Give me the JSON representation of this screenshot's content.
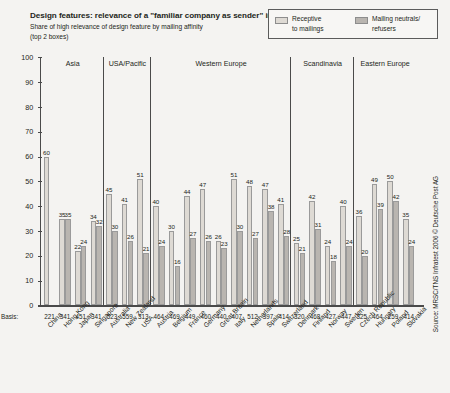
{
  "header": {
    "title": "Design features: relevance of a \"familiar company as sender\" in %",
    "subtitle_line1": "Share of high relevance of design feature by mailing affinity",
    "subtitle_line2": "(top 2 boxes)"
  },
  "legend": {
    "items": [
      {
        "label": "Receptive\nto mailings",
        "color": "#dedad4"
      },
      {
        "label": "Mailing neutrals/\nrefusers",
        "color": "#b9b5b0"
      }
    ]
  },
  "source": "Source: MRSC/TNS Infratest 2006 © Deutsche Post AG",
  "axis": {
    "basis_label": "Basis:",
    "y_ticks": [
      "100",
      "90",
      "80",
      "70",
      "60",
      "50",
      "40",
      "30",
      "20",
      "10",
      "0"
    ]
  },
  "chart_data": {
    "type": "bar",
    "title": "Design features: relevance of a \"familiar company as sender\" in %",
    "subtitle": "Share of high relevance of design feature by mailing affinity (top 2 boxes)",
    "xlabel": "",
    "ylabel": "%",
    "ylim": [
      0,
      100
    ],
    "ytick_step": 10,
    "grid": false,
    "legend_position": "top-right",
    "categories": [
      "China",
      "Hong Kong",
      "Japan",
      "Singapore",
      "Australia",
      "New Zealand",
      "USA",
      "Austria",
      "Belgium",
      "France",
      "Germany",
      "Great Britain",
      "Italy",
      "Netherlands",
      "Spain",
      "Switzerland",
      "Denmark",
      "Finland",
      "Norway",
      "Sweden",
      "Czech Republic",
      "Hungary",
      "Poland",
      "Slovakia"
    ],
    "basis": [
      221,
      341,
      451,
      341,
      523,
      559,
      313,
      464,
      469,
      449,
      460,
      440,
      407,
      512,
      397,
      414,
      320,
      468,
      427,
      447,
      325,
      464,
      259,
      414
    ],
    "series": [
      {
        "name": "Receptive to mailings",
        "color": "#dedad4",
        "values": [
          60,
          35,
          22,
          34,
          45,
          41,
          51,
          40,
          30,
          44,
          47,
          26,
          51,
          48,
          47,
          41,
          25,
          42,
          24,
          40,
          36,
          49,
          50,
          35
        ]
      },
      {
        "name": "Mailing neutrals/refusers",
        "color": "#b9b5b0",
        "values": [
          null,
          35,
          24,
          32,
          30,
          26,
          21,
          24,
          16,
          27,
          26,
          23,
          30,
          27,
          38,
          28,
          21,
          31,
          18,
          24,
          20,
          39,
          42,
          24
        ]
      }
    ],
    "groups": [
      {
        "label": "Asia",
        "start": 0,
        "end": 3
      },
      {
        "label": "USA/Pacific",
        "start": 4,
        "end": 6
      },
      {
        "label": "Western Europe",
        "start": 7,
        "end": 15
      },
      {
        "label": "Scandinavia",
        "start": 16,
        "end": 19
      },
      {
        "label": "Eastern Europe",
        "start": 20,
        "end": 23
      }
    ]
  }
}
